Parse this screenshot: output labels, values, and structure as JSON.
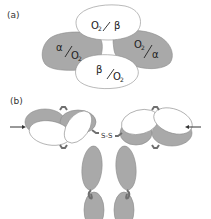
{
  "figure": {
    "panel_a": {
      "label": "(a)",
      "subunits": [
        {
          "id": "top",
          "chain": "β",
          "text_main": "O",
          "text_sub": "2",
          "text_slash": "/",
          "text_greek": "β",
          "order": "O2/β",
          "shading": "white"
        },
        {
          "id": "left",
          "chain": "α",
          "text_main": "O",
          "text_sub": "2",
          "text_slash": "/",
          "text_greek": "α",
          "order": "α/O2",
          "shading": "gray"
        },
        {
          "id": "right",
          "chain": "α",
          "text_main": "O",
          "text_sub": "2",
          "text_slash": "/",
          "text_greek": "α",
          "order": "O2/α",
          "shading": "gray"
        },
        {
          "id": "bottom",
          "chain": "β",
          "text_main": "O",
          "text_sub": "2",
          "text_slash": "/",
          "text_greek": "β",
          "order": "β/O2",
          "shading": "white"
        }
      ]
    },
    "panel_b": {
      "label": "(b)",
      "disulfide_label": "S-S",
      "arrows": [
        "left-arrow",
        "right-arrow"
      ]
    }
  },
  "colors": {
    "gray_fill": "#a9a9a9",
    "white_fill": "#ffffff",
    "outline": "#8a8a8a",
    "linker": "#6f6f6f",
    "text": "#222222"
  }
}
